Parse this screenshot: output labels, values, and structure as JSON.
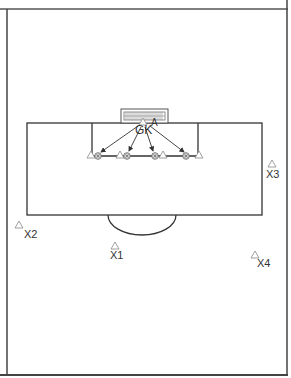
{
  "diagram": {
    "type": "soccer-drill",
    "caption_cut": "(partially visible caption text)",
    "colors": {
      "lines": "#333333",
      "frame": "#555555",
      "cone": "#888888",
      "ball": "#555555",
      "text": "#333333"
    },
    "goal": {
      "label": "goal"
    },
    "labels": {
      "goalkeeper": "GK",
      "attacker": "A",
      "players": [
        {
          "id": "X1",
          "label": "X1",
          "cone_x": 115,
          "cone_y": 246,
          "text_x": 116,
          "text_y": 259
        },
        {
          "id": "X2",
          "label": "X2",
          "cone_x": 19,
          "cone_y": 225,
          "text_x": 31,
          "text_y": 239
        },
        {
          "id": "X3",
          "label": "X3",
          "cone_x": 272,
          "cone_y": 164,
          "text_x": 272,
          "text_y": 177
        },
        {
          "id": "X4",
          "label": "X4",
          "cone_x": 255,
          "cone_y": 255,
          "text_x": 263,
          "text_y": 268
        }
      ]
    },
    "line_cones": [
      {
        "x": 91,
        "y": 155
      },
      {
        "x": 120,
        "y": 155
      },
      {
        "x": 163,
        "y": 155
      },
      {
        "x": 198,
        "y": 155
      }
    ],
    "balls": [
      {
        "x": 98,
        "y": 156
      },
      {
        "x": 127,
        "y": 156
      },
      {
        "x": 155,
        "y": 156
      },
      {
        "x": 186,
        "y": 156
      }
    ],
    "arrows": [
      {
        "from": [
          138,
          126
        ],
        "to": [
          101,
          152
        ]
      },
      {
        "from": [
          141,
          127
        ],
        "to": [
          129,
          151
        ]
      },
      {
        "from": [
          145,
          127
        ],
        "to": [
          153,
          151
        ]
      },
      {
        "from": [
          150,
          126
        ],
        "to": [
          184,
          152
        ]
      }
    ]
  }
}
